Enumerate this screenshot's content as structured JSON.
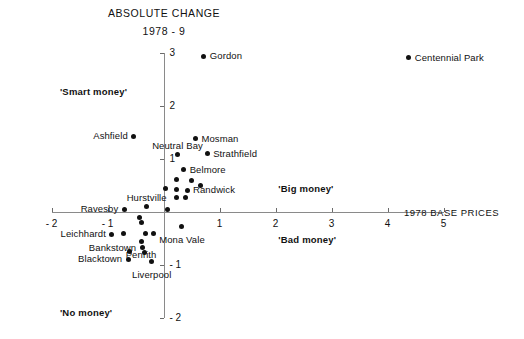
{
  "title": "ABSOLUTE CHANGE",
  "subtitle": "1978 - 9",
  "x_axis_title": "1978 BASE PRICES",
  "quadrant_labels": {
    "top_left": "'Smart money'",
    "mid_right": "'Big money'",
    "bottom_right": "'Bad money'",
    "bottom_left": "'No money'"
  },
  "chart_data": {
    "type": "scatter",
    "title": "ABSOLUTE CHANGE",
    "subtitle": "1978 - 9",
    "xlabel": "1978 BASE PRICES",
    "ylabel": "ABSOLUTE CHANGE 1978 - 9",
    "xlim": [
      -2,
      5
    ],
    "ylim": [
      -2,
      3
    ],
    "xticks": [
      -2,
      -1,
      0,
      1,
      2,
      3,
      4,
      5
    ],
    "xtick_labels": [
      "- 2",
      "- 1",
      "",
      "1",
      "2",
      "3",
      "4",
      "5"
    ],
    "yticks": [
      -2,
      -1,
      0,
      1,
      2,
      3
    ],
    "ytick_labels": [
      "- 2",
      "- 1",
      "",
      "1",
      "2",
      "3"
    ],
    "grid": false,
    "legend": "none",
    "axes_style": "crossed-at-origin",
    "quadrant_annotations": [
      {
        "text": "'Smart money'",
        "x": -1.85,
        "y": 2.35
      },
      {
        "text": "'Big money'",
        "x": 2.05,
        "y": 0.52
      },
      {
        "text": "'Bad money'",
        "x": 2.05,
        "y": -0.45
      },
      {
        "text": "'No money'",
        "x": -1.85,
        "y": -1.82
      }
    ],
    "points": [
      {
        "name": "Gordon",
        "x": 0.72,
        "y": 2.93,
        "label_side": "right"
      },
      {
        "name": "Centennial Park",
        "x": 4.38,
        "y": 2.9,
        "label_side": "right"
      },
      {
        "name": "Ashfield",
        "x": -0.53,
        "y": 1.42,
        "label_side": "left"
      },
      {
        "name": "Mosman",
        "x": 0.57,
        "y": 1.37,
        "label_side": "right"
      },
      {
        "name": "Neutral Bay",
        "x": 0.25,
        "y": 1.07,
        "label_side": "above"
      },
      {
        "name": "Strathfield",
        "x": 0.78,
        "y": 1.09,
        "label_side": "right"
      },
      {
        "name": "Belmore",
        "x": 0.36,
        "y": 0.79,
        "label_side": "right"
      },
      {
        "name": "",
        "x": 0.23,
        "y": 0.6,
        "label_side": "none"
      },
      {
        "name": "",
        "x": 0.5,
        "y": 0.58,
        "label_side": "none"
      },
      {
        "name": "",
        "x": 0.66,
        "y": 0.5,
        "label_side": "none"
      },
      {
        "name": "",
        "x": 0.04,
        "y": 0.43,
        "label_side": "none"
      },
      {
        "name": "",
        "x": 0.24,
        "y": 0.42,
        "label_side": "none"
      },
      {
        "name": "Randwick",
        "x": 0.42,
        "y": 0.4,
        "label_side": "right"
      },
      {
        "name": "",
        "x": 0.24,
        "y": 0.26,
        "label_side": "none"
      },
      {
        "name": "",
        "x": 0.4,
        "y": 0.26,
        "label_side": "none"
      },
      {
        "name": "Hurstville",
        "x": -0.3,
        "y": 0.09,
        "label_side": "above"
      },
      {
        "name": "",
        "x": 0.07,
        "y": 0.03,
        "label_side": "none"
      },
      {
        "name": "Ravesby",
        "x": -0.7,
        "y": 0.04,
        "label_side": "left"
      },
      {
        "name": "",
        "x": -0.42,
        "y": -0.12,
        "label_side": "none"
      },
      {
        "name": "",
        "x": -0.4,
        "y": -0.21,
        "label_side": "none"
      },
      {
        "name": "Mona Vale",
        "x": 0.33,
        "y": -0.29,
        "label_side": "below"
      },
      {
        "name": "Leichhardt",
        "x": -0.92,
        "y": -0.43,
        "label_side": "left"
      },
      {
        "name": "",
        "x": -0.72,
        "y": -0.41,
        "label_side": "none"
      },
      {
        "name": "",
        "x": -0.33,
        "y": -0.41,
        "label_side": "none"
      },
      {
        "name": "",
        "x": -0.18,
        "y": -0.41,
        "label_side": "none"
      },
      {
        "name": "Penrith",
        "x": -0.4,
        "y": -0.57,
        "label_side": "below"
      },
      {
        "name": "Bankstown",
        "x": -0.38,
        "y": -0.68,
        "label_side": "left"
      },
      {
        "name": "",
        "x": -0.6,
        "y": -0.75,
        "label_side": "none"
      },
      {
        "name": "",
        "x": -0.34,
        "y": -0.78,
        "label_side": "none"
      },
      {
        "name": "Blacktown",
        "x": -0.63,
        "y": -0.9,
        "label_side": "left"
      },
      {
        "name": "Liverpool",
        "x": -0.21,
        "y": -0.95,
        "label_side": "below"
      }
    ]
  }
}
